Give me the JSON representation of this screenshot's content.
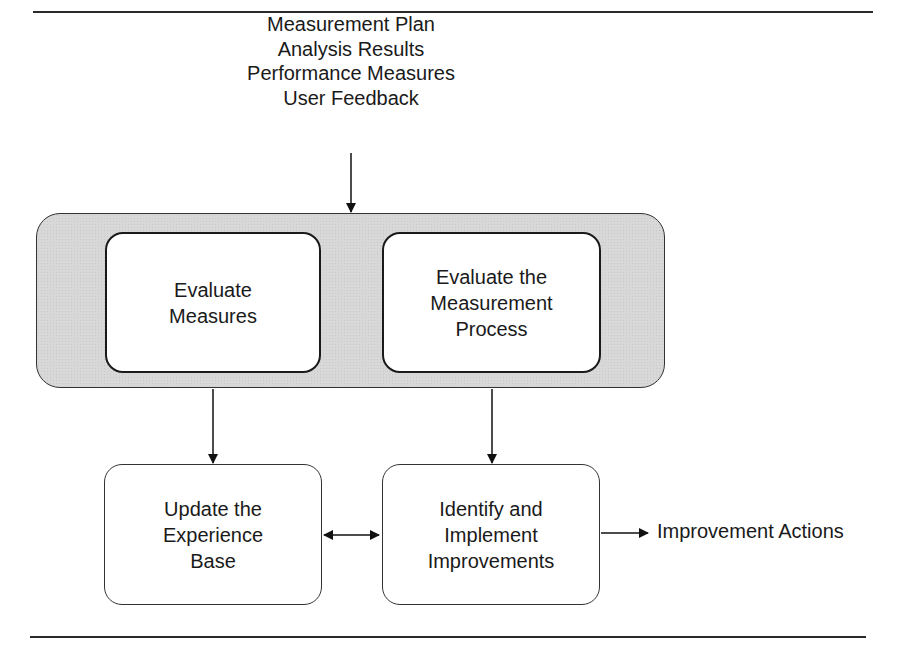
{
  "diagram": {
    "inputs": [
      "Measurement Plan",
      "Analysis Results",
      "Performance Measures",
      "User Feedback"
    ],
    "group": {
      "boxes": [
        {
          "id": "evaluate-measures",
          "lines": [
            "Evaluate",
            "Measures"
          ]
        },
        {
          "id": "evaluate-process",
          "lines": [
            "Evaluate the",
            "Measurement",
            "Process"
          ]
        }
      ]
    },
    "lower_boxes": [
      {
        "id": "update-experience-base",
        "lines": [
          "Update the",
          "Experience",
          "Base"
        ]
      },
      {
        "id": "identify-implement",
        "lines": [
          "Identify and",
          "Implement",
          "Improvements"
        ]
      }
    ],
    "output": "Improvement Actions",
    "edges": [
      {
        "from": "inputs",
        "to": "group",
        "type": "arrow"
      },
      {
        "from": "evaluate-measures",
        "to": "update-experience-base",
        "type": "arrow"
      },
      {
        "from": "evaluate-process",
        "to": "identify-implement",
        "type": "arrow"
      },
      {
        "from": "update-experience-base",
        "to": "identify-implement",
        "type": "bidirectional"
      },
      {
        "from": "identify-implement",
        "to": "output",
        "type": "arrow"
      }
    ],
    "colors": {
      "group_fill": "#d8d8d8",
      "stroke": "#1a1a1a",
      "box_fill": "#ffffff"
    }
  }
}
